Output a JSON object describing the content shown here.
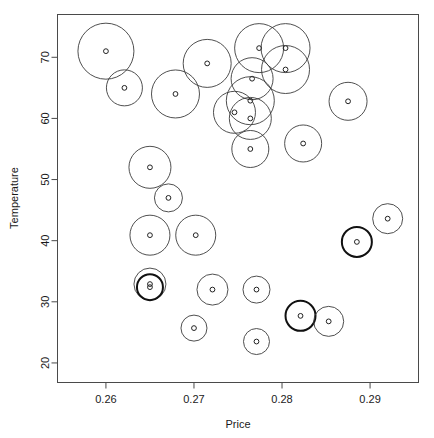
{
  "chart_data": {
    "type": "scatter",
    "variant": "bubble",
    "title": "",
    "xlabel": "Price",
    "ylabel": "Temperature",
    "xlim": [
      0.2545,
      0.2955
    ],
    "ylim": [
      16.8,
      77.0
    ],
    "grid": false,
    "legend": null,
    "xticks": [
      0.26,
      0.27,
      0.28,
      0.29
    ],
    "xticklabels": [
      "0.26",
      "0.27",
      "0.28",
      "0.29"
    ],
    "yticks": [
      20,
      30,
      40,
      50,
      60,
      70
    ],
    "yticklabels": [
      "20",
      "30",
      "40",
      "50",
      "60",
      "70"
    ],
    "size_encoding": "circle radius proportional to a third variable",
    "center_marker": "small open circle at each data point",
    "points": [
      {
        "x": 0.26,
        "y": 71.0,
        "r": 28.0,
        "bold": false
      },
      {
        "x": 0.2621,
        "y": 65.0,
        "r": 18.0,
        "bold": false
      },
      {
        "x": 0.2679,
        "y": 64.0,
        "r": 24.0,
        "bold": false
      },
      {
        "x": 0.2715,
        "y": 69.0,
        "r": 24.0,
        "bold": false
      },
      {
        "x": 0.2774,
        "y": 71.5,
        "r": 24.5,
        "bold": false
      },
      {
        "x": 0.2804,
        "y": 71.5,
        "r": 24.5,
        "bold": false
      },
      {
        "x": 0.2804,
        "y": 68.0,
        "r": 24.0,
        "bold": false
      },
      {
        "x": 0.2766,
        "y": 66.5,
        "r": 21.0,
        "bold": false
      },
      {
        "x": 0.2764,
        "y": 62.9,
        "r": 24.0,
        "bold": false
      },
      {
        "x": 0.2746,
        "y": 61.0,
        "r": 21.0,
        "bold": false
      },
      {
        "x": 0.2764,
        "y": 60.0,
        "r": 21.0,
        "bold": false
      },
      {
        "x": 0.2875,
        "y": 62.8,
        "r": 19.0,
        "bold": false
      },
      {
        "x": 0.2764,
        "y": 55.0,
        "r": 18.5,
        "bold": false
      },
      {
        "x": 0.2824,
        "y": 55.9,
        "r": 18.5,
        "bold": false
      },
      {
        "x": 0.265,
        "y": 52.0,
        "r": 21.0,
        "bold": false
      },
      {
        "x": 0.2671,
        "y": 47.0,
        "r": 14.0,
        "bold": false
      },
      {
        "x": 0.265,
        "y": 40.9,
        "r": 20.0,
        "bold": false
      },
      {
        "x": 0.2702,
        "y": 40.9,
        "r": 20.0,
        "bold": false
      },
      {
        "x": 0.2885,
        "y": 39.8,
        "r": 15.0,
        "bold": true
      },
      {
        "x": 0.292,
        "y": 43.6,
        "r": 15.0,
        "bold": false
      },
      {
        "x": 0.265,
        "y": 32.9,
        "r": 16.0,
        "bold": false
      },
      {
        "x": 0.265,
        "y": 32.4,
        "r": 13.0,
        "bold": true
      },
      {
        "x": 0.2721,
        "y": 32.0,
        "r": 15.5,
        "bold": false
      },
      {
        "x": 0.2771,
        "y": 32.0,
        "r": 13.5,
        "bold": false
      },
      {
        "x": 0.2821,
        "y": 27.7,
        "r": 15.0,
        "bold": true
      },
      {
        "x": 0.2853,
        "y": 26.8,
        "r": 15.0,
        "bold": false
      },
      {
        "x": 0.27,
        "y": 25.7,
        "r": 13.0,
        "bold": false
      },
      {
        "x": 0.2771,
        "y": 23.5,
        "r": 13.0,
        "bold": false
      }
    ]
  },
  "axes": {
    "x_title": "Price",
    "y_title": "Temperature"
  }
}
